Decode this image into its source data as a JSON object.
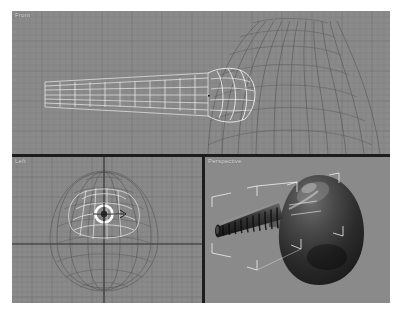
{
  "app": {
    "type": "3d-modeling-viewport-layout",
    "background_color": "#8a8a8a",
    "divider_color": "#1d1d1d",
    "grid_color": "#6f6f6f",
    "axis_color": "#2a2a2a",
    "selection_color": "#f2f2f2",
    "mesh_color": "#4a4a4a"
  },
  "viewports": {
    "front": {
      "label": "Front",
      "grid": true,
      "contents": "wireframe of tapered ribbed tube joined to large dome mesh",
      "selected_object": "tube"
    },
    "left": {
      "label": "Left",
      "grid": true,
      "contents": "egg / teardrop shaped wireframe viewed head-on with tube seen end-on at centre",
      "selected_object": "tube"
    },
    "perspective": {
      "label": "Perspective",
      "grid": false,
      "contents": "shaded dark balloon with ribbed neck tube, white selection brackets around tube",
      "selected_object": "tube"
    }
  }
}
